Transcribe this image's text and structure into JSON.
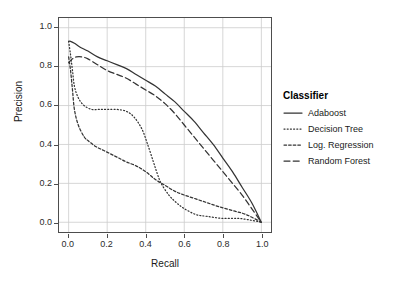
{
  "chart_data": {
    "type": "line",
    "title": "",
    "xlabel": "Recall",
    "ylabel": "Precision",
    "xlim": [
      -0.05,
      1.05
    ],
    "ylim": [
      -0.05,
      1.05
    ],
    "xticks": [
      "0.0",
      "0.2",
      "0.4",
      "0.6",
      "0.8",
      "1.0"
    ],
    "yticks": [
      "0.0",
      "0.2",
      "0.4",
      "0.6",
      "0.8",
      "1.0"
    ],
    "grid": true,
    "legend_position": "right",
    "legend_title": "Classifier",
    "series": [
      {
        "name": "Adaboost",
        "linestyle": "solid",
        "color": "#333333",
        "x": [
          0.0,
          0.01,
          0.03,
          0.06,
          0.1,
          0.15,
          0.2,
          0.25,
          0.3,
          0.35,
          0.4,
          0.45,
          0.5,
          0.55,
          0.6,
          0.65,
          0.7,
          0.75,
          0.8,
          0.85,
          0.9,
          0.95,
          1.0
        ],
        "y": [
          0.93,
          0.93,
          0.92,
          0.9,
          0.88,
          0.85,
          0.83,
          0.81,
          0.79,
          0.76,
          0.73,
          0.7,
          0.66,
          0.62,
          0.57,
          0.52,
          0.46,
          0.4,
          0.33,
          0.26,
          0.18,
          0.1,
          0.0
        ]
      },
      {
        "name": "Decision Tree",
        "linestyle": "dotted",
        "color": "#333333",
        "x": [
          0.0,
          0.01,
          0.02,
          0.03,
          0.05,
          0.08,
          0.12,
          0.16,
          0.2,
          0.25,
          0.3,
          0.34,
          0.38,
          0.41,
          0.44,
          0.46,
          0.48,
          0.52,
          0.56,
          0.6,
          0.66,
          0.72,
          0.8,
          0.88,
          0.95,
          1.0
        ],
        "y": [
          0.93,
          0.86,
          0.78,
          0.7,
          0.64,
          0.6,
          0.58,
          0.58,
          0.58,
          0.58,
          0.57,
          0.54,
          0.48,
          0.4,
          0.31,
          0.25,
          0.2,
          0.14,
          0.1,
          0.07,
          0.04,
          0.03,
          0.02,
          0.02,
          0.01,
          0.0
        ]
      },
      {
        "name": "Log. Regression",
        "linestyle": "dashdot",
        "color": "#333333",
        "x": [
          0.0,
          0.01,
          0.02,
          0.03,
          0.05,
          0.08,
          0.1,
          0.14,
          0.18,
          0.22,
          0.26,
          0.3,
          0.35,
          0.4,
          0.45,
          0.5,
          0.55,
          0.6,
          0.66,
          0.72,
          0.78,
          0.85,
          0.92,
          1.0
        ],
        "y": [
          0.85,
          0.78,
          0.68,
          0.58,
          0.5,
          0.44,
          0.42,
          0.39,
          0.37,
          0.35,
          0.33,
          0.31,
          0.29,
          0.26,
          0.22,
          0.19,
          0.16,
          0.14,
          0.12,
          0.1,
          0.08,
          0.06,
          0.04,
          0.0
        ]
      },
      {
        "name": "Random Forest",
        "linestyle": "dashed",
        "color": "#333333",
        "x": [
          0.0,
          0.02,
          0.04,
          0.07,
          0.1,
          0.15,
          0.2,
          0.25,
          0.3,
          0.35,
          0.4,
          0.45,
          0.5,
          0.55,
          0.6,
          0.65,
          0.7,
          0.75,
          0.8,
          0.85,
          0.9,
          0.95,
          1.0
        ],
        "y": [
          0.82,
          0.84,
          0.85,
          0.85,
          0.84,
          0.81,
          0.78,
          0.76,
          0.74,
          0.71,
          0.68,
          0.65,
          0.61,
          0.56,
          0.5,
          0.44,
          0.38,
          0.32,
          0.26,
          0.2,
          0.14,
          0.07,
          0.0
        ]
      }
    ]
  },
  "legend": {
    "title": "Classifier",
    "items": [
      {
        "label": "Adaboost",
        "key": "line-solid-icon"
      },
      {
        "label": "Decision Tree",
        "key": "line-dotted-icon"
      },
      {
        "label": "Log. Regression",
        "key": "line-dashdot-icon"
      },
      {
        "label": "Random Forest",
        "key": "line-dashed-icon"
      }
    ]
  },
  "axes": {
    "x": {
      "label": "Recall",
      "ticks": [
        "0.0",
        "0.2",
        "0.4",
        "0.6",
        "0.8",
        "1.0"
      ]
    },
    "y": {
      "label": "Precision",
      "ticks": [
        "0.0",
        "0.2",
        "0.4",
        "0.6",
        "0.8",
        "1.0"
      ]
    }
  }
}
